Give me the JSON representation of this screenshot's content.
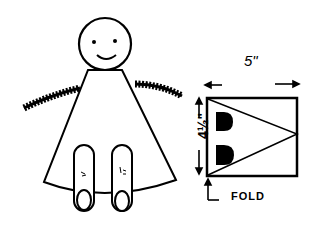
{
  "diagram": {
    "figure": {
      "name": "cone doll with pipe-cleaner arms",
      "parts": [
        "head with smiling face",
        "cone body",
        "fuzzy pipe-cleaner arms",
        "two legs with feet"
      ]
    },
    "pattern": {
      "width_label": "5\"",
      "height_label": "4½\"",
      "fold_label": "FOLD",
      "cutouts": 2
    },
    "colors": {
      "ink": "#000000",
      "paper": "#ffffff"
    }
  }
}
